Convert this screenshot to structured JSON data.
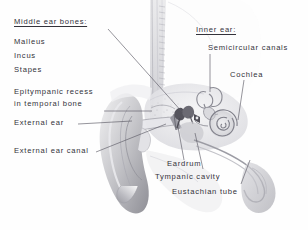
{
  "figure": {
    "background_color": "#fefefe",
    "text_color": "#33323a",
    "leader_color": "#5d5b66"
  },
  "labels": {
    "middle_ear_heading": "Middle ear bones:",
    "malleus": "Malleus",
    "incus": "Incus",
    "stapes": "Stapes",
    "epitympanic_line1": "Epitympanic recess",
    "epitympanic_line2": "in temporal bone",
    "external_ear": "External ear",
    "external_ear_canal": "External ear canal",
    "inner_ear_heading": "Inner ear:",
    "semicircular_canals": "Semicircular canals",
    "cochlea": "Cochlea",
    "eardrum": "Eardrum",
    "tympanic_cavity": "Tympanic cavity",
    "eustachian_tube": "Eustachian tube"
  }
}
